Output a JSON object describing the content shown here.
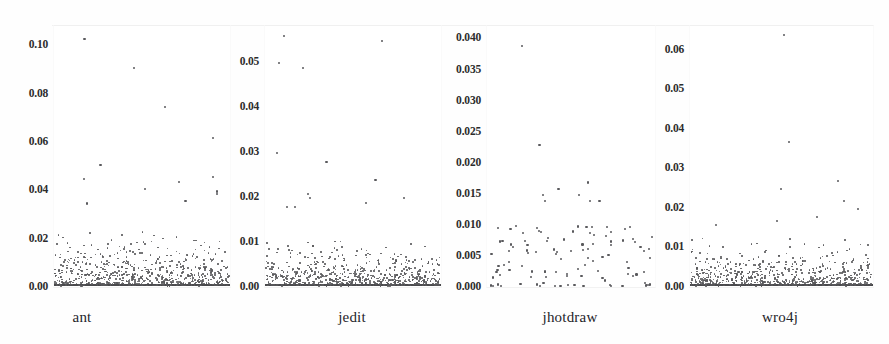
{
  "figure": {
    "width": 889,
    "height": 344,
    "background": "#fefefe",
    "point_color": "#59595c",
    "text_color": "#24242a"
  },
  "chart_data": {
    "type": "scatter",
    "title": "",
    "xlabel": "",
    "ylabel": "",
    "grid": false,
    "legend": null,
    "layout": "4 panels side-by-side, shared scatter-strip format, independent y axes",
    "panels": [
      {
        "name": "ant",
        "xlabel": "ant",
        "ylim": [
          0.0,
          0.108
        ],
        "yticks": [
          0.0,
          0.02,
          0.04,
          0.06,
          0.08,
          0.1
        ],
        "ytick_labels": [
          "0.00",
          "0.02",
          "0.04",
          "0.06",
          "0.08",
          "0.10"
        ],
        "n_points": 740,
        "density": "very dense",
        "notes": "heavy mass below 0.02 with solid baseline at 0.00; sparse outliers up to 0.103",
        "max_value": 0.103,
        "outliers": [
          0.103,
          0.091,
          0.075,
          0.062,
          0.051,
          0.046,
          0.045,
          0.044,
          0.041,
          0.04,
          0.039,
          0.036,
          0.035
        ],
        "bulk_upper": 0.022
      },
      {
        "name": "jedit",
        "xlabel": "jedit",
        "ylim": [
          0.0,
          0.058
        ],
        "yticks": [
          0.0,
          0.01,
          0.02,
          0.03,
          0.04,
          0.05
        ],
        "ytick_labels": [
          "0.00",
          "0.01",
          "0.02",
          "0.03",
          "0.04",
          "0.05"
        ],
        "n_points": 780,
        "density": "very dense",
        "notes": "mass below 0.006 with solid baseline at 0.00; outliers to 0.056",
        "max_value": 0.056,
        "outliers": [
          0.056,
          0.055,
          0.05,
          0.049,
          0.03,
          0.028,
          0.024,
          0.021,
          0.02,
          0.02,
          0.019,
          0.018,
          0.018
        ],
        "bulk_upper": 0.01
      },
      {
        "name": "jhotdraw",
        "xlabel": "jhotdraw",
        "ylim": [
          0.0,
          0.042
        ],
        "yticks": [
          0.0,
          0.005,
          0.01,
          0.015,
          0.02,
          0.025,
          0.03,
          0.035,
          0.04
        ],
        "ytick_labels": [
          "0.000",
          "0.005",
          "0.010",
          "0.015",
          "0.020",
          "0.025",
          "0.030",
          "0.035",
          "0.040"
        ],
        "n_points": 105,
        "density": "sparse",
        "notes": "scattered individual points mostly under 0.010; a few zeros along baseline; top outlier near 0.039",
        "max_value": 0.039,
        "outliers": [
          0.039,
          0.023,
          0.017,
          0.016,
          0.015,
          0.015,
          0.014,
          0.014,
          0.014
        ],
        "bulk_upper": 0.01
      },
      {
        "name": "wro4j",
        "xlabel": "wro4j",
        "ylim": [
          0.0,
          0.066
        ],
        "yticks": [
          0.0,
          0.01,
          0.02,
          0.03,
          0.04,
          0.05,
          0.06
        ],
        "ytick_labels": [
          "0.00",
          "0.01",
          "0.02",
          "0.03",
          "0.04",
          "0.05",
          "0.06"
        ],
        "n_points": 700,
        "density": "very dense",
        "notes": "dense band under 0.006 hugging the baseline; outliers at 0.064, 0.037, 0.027",
        "max_value": 0.064,
        "outliers": [
          0.064,
          0.037,
          0.027,
          0.025,
          0.022,
          0.02,
          0.018,
          0.017,
          0.016
        ],
        "bulk_upper": 0.012
      }
    ]
  }
}
